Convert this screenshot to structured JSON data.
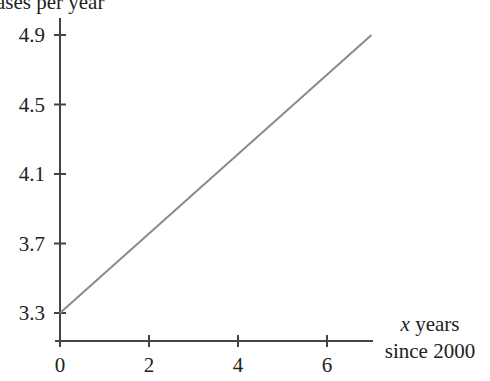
{
  "chart_data": {
    "type": "line",
    "title": "",
    "ylabel": "ases per year",
    "xlabel_line1_italic": "x",
    "xlabel_line1_rest": " years",
    "xlabel_line2": "since 2000",
    "x_ticks": [
      "0",
      "2",
      "4",
      "6"
    ],
    "y_ticks": [
      "3.3",
      "3.7",
      "4.1",
      "4.5",
      "4.9"
    ],
    "xlim": [
      0,
      7
    ],
    "ylim": [
      3.3,
      4.9
    ],
    "grid": false,
    "series": [
      {
        "name": "line",
        "color": "#8a8a8a",
        "points": [
          [
            0,
            3.3
          ],
          [
            7,
            4.9
          ]
        ]
      }
    ]
  },
  "colors": {
    "axis": "#444444",
    "line": "#8a8a8a",
    "text": "#222222"
  }
}
